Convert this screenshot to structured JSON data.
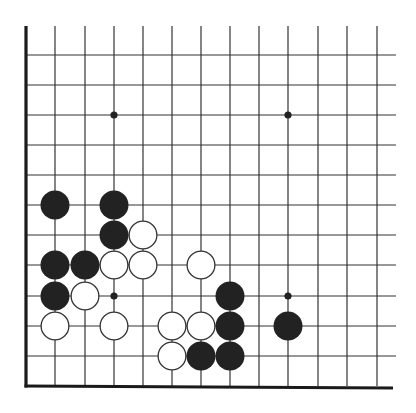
{
  "board": {
    "origin_x": 26,
    "origin_y": 26,
    "col_spacing": 29.25,
    "row_spacing": 30.0,
    "cols": 13,
    "grid_right": 396,
    "grid_bottom": 386,
    "line_color": "#333333",
    "edge_color": "#1a1a1a",
    "black_color": "#222222",
    "white_fill": "#ffffff",
    "white_stroke": "#333333",
    "stone_radius": 14.5,
    "hoshi_radius": 3.6,
    "row_lines_y": [
      55,
      85,
      115,
      145,
      175,
      205,
      235,
      265,
      296,
      326,
      356
    ],
    "col_lines_x": [
      55,
      85,
      114,
      143,
      172,
      201,
      230,
      259,
      288,
      318,
      347,
      377
    ]
  },
  "hoshi": [
    {
      "c": 3,
      "r": 3
    },
    {
      "c": 9,
      "r": 3
    },
    {
      "c": 3,
      "r": 9
    },
    {
      "c": 9,
      "r": 9
    }
  ],
  "stones": [
    {
      "color": "black",
      "c": 1,
      "r": 6
    },
    {
      "color": "black",
      "c": 3,
      "r": 6
    },
    {
      "color": "black",
      "c": 3,
      "r": 7
    },
    {
      "color": "white",
      "c": 4,
      "r": 7
    },
    {
      "color": "black",
      "c": 1,
      "r": 8
    },
    {
      "color": "black",
      "c": 2,
      "r": 8
    },
    {
      "color": "white",
      "c": 3,
      "r": 8
    },
    {
      "color": "white",
      "c": 4,
      "r": 8
    },
    {
      "color": "white",
      "c": 6,
      "r": 8
    },
    {
      "color": "black",
      "c": 1,
      "r": 9
    },
    {
      "color": "white",
      "c": 2,
      "r": 9
    },
    {
      "color": "black",
      "c": 7,
      "r": 9
    },
    {
      "color": "white",
      "c": 1,
      "r": 10
    },
    {
      "color": "white",
      "c": 3,
      "r": 10
    },
    {
      "color": "white",
      "c": 5,
      "r": 10
    },
    {
      "color": "white",
      "c": 6,
      "r": 10
    },
    {
      "color": "black",
      "c": 7,
      "r": 10
    },
    {
      "color": "black",
      "c": 9,
      "r": 10
    },
    {
      "color": "white",
      "c": 5,
      "r": 11
    },
    {
      "color": "black",
      "c": 6,
      "r": 11
    },
    {
      "color": "black",
      "c": 7,
      "r": 11
    }
  ]
}
